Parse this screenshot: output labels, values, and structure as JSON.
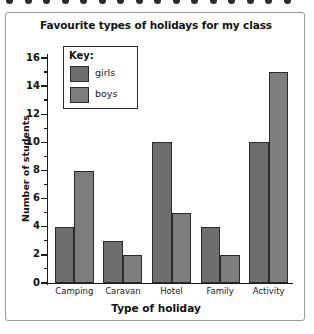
{
  "decoration": {
    "dot_count": 16,
    "dot_color": "#2b2b2b"
  },
  "frame": {
    "border_color": "#9a9a9a"
  },
  "chart_data": {
    "type": "bar",
    "title": "Favourite types of holidays for my class",
    "xlabel": "Type of holiday",
    "ylabel": "Number of students",
    "categories": [
      "Camping",
      "Caravan",
      "Hotel",
      "Family",
      "Activity"
    ],
    "series": [
      {
        "name": "girls",
        "color": "#6e6e6e",
        "values": [
          4,
          3,
          10,
          4,
          10
        ]
      },
      {
        "name": "boys",
        "color": "#7e7e7e",
        "values": [
          8,
          2,
          5,
          2,
          15
        ]
      }
    ],
    "ylim": [
      0,
      16
    ],
    "ytick_step": 2,
    "yminor_step": 1,
    "ytick_labels": [
      "0",
      "2",
      "4",
      "6",
      "8",
      "10",
      "12",
      "14",
      "16"
    ],
    "yminor_labels": [
      "1",
      "3",
      "5",
      "7",
      "9",
      "11",
      "13",
      "15"
    ],
    "grid": false,
    "legend_position": "upper-left-inside",
    "legend_title": "Key:"
  }
}
